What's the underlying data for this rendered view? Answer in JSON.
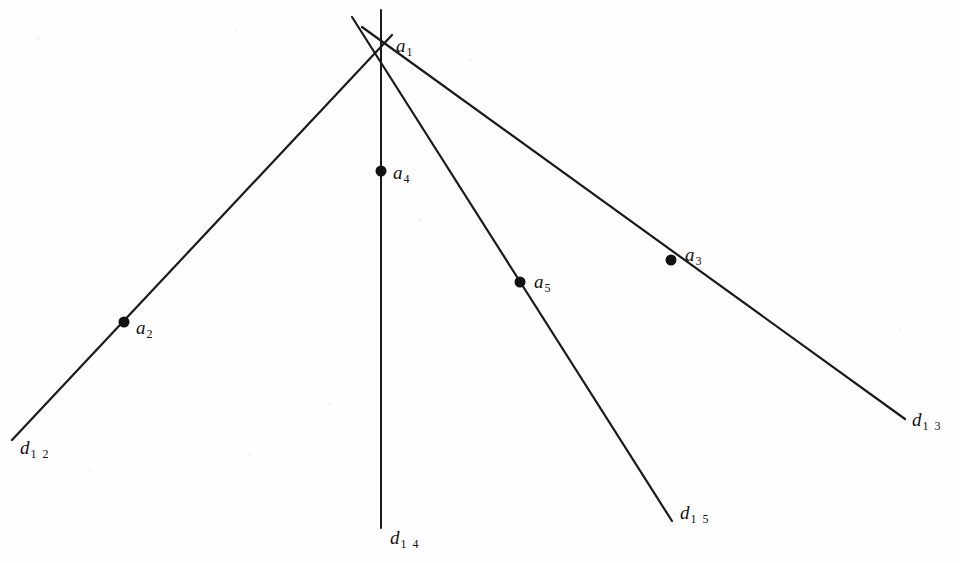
{
  "figure": {
    "background_color": "#fefefe",
    "line_color": "#1a1a1a",
    "point_color": "#111111",
    "vertex": {
      "name": "a1",
      "label_base": "a",
      "label_sub": "1",
      "x": 381,
      "y": 47,
      "label_x": 396,
      "label_y": 36
    },
    "points": [
      {
        "name": "a2",
        "label_base": "a",
        "label_sub": "2",
        "x": 124,
        "y": 322,
        "label_x": 136,
        "label_y": 318,
        "radius": 5.5
      },
      {
        "name": "a3",
        "label_base": "a",
        "label_sub": "3",
        "x": 671,
        "y": 260,
        "label_x": 685,
        "label_y": 245,
        "radius": 5.5
      },
      {
        "name": "a4",
        "label_base": "a",
        "label_sub": "4",
        "x": 381,
        "y": 171,
        "label_x": 393,
        "label_y": 163,
        "radius": 5.5
      },
      {
        "name": "a5",
        "label_base": "a",
        "label_sub": "5",
        "x": 520,
        "y": 282,
        "label_x": 534,
        "label_y": 272,
        "radius": 5.5
      }
    ],
    "lines": [
      {
        "name": "d12",
        "label_base": "d",
        "label_sub": "1 2",
        "x1": 392,
        "y1": 35,
        "x2": 12,
        "y2": 440,
        "label_x": 20,
        "label_y": 438,
        "width": 2.2
      },
      {
        "name": "d13",
        "label_base": "d",
        "label_sub": "1 3",
        "x1": 362,
        "y1": 27,
        "x2": 905,
        "y2": 419,
        "label_x": 912,
        "label_y": 410,
        "width": 2.2
      },
      {
        "name": "d14",
        "label_base": "d",
        "label_sub": "1 4",
        "x1": 381,
        "y1": 10,
        "x2": 381,
        "y2": 528,
        "label_x": 390,
        "label_y": 528,
        "width": 2.0
      },
      {
        "name": "d15",
        "label_base": "d",
        "label_sub": "1 5",
        "x1": 352,
        "y1": 17,
        "x2": 672,
        "y2": 521,
        "label_x": 680,
        "label_y": 503,
        "width": 2.2
      }
    ]
  }
}
